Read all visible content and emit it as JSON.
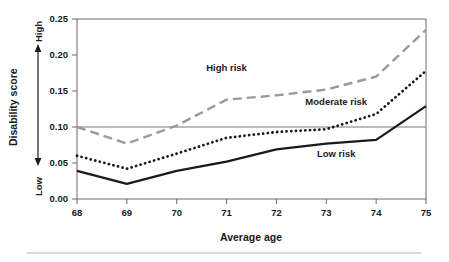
{
  "chart_data": {
    "type": "line",
    "title": "",
    "xlabel": "Average age",
    "ylabel": "Disability score",
    "x": [
      68,
      69,
      70,
      71,
      72,
      73,
      74,
      75
    ],
    "xlim": [
      68,
      75
    ],
    "ylim": [
      0.0,
      0.25
    ],
    "xticks": [
      "68",
      "69",
      "70",
      "71",
      "72",
      "73",
      "74",
      "75"
    ],
    "yticks": [
      "0.00",
      "0.05",
      "0.10",
      "0.15",
      "0.20",
      "0.25"
    ],
    "ytick_values": [
      0.0,
      0.05,
      0.1,
      0.15,
      0.2,
      0.25
    ],
    "y_axis_low_label": "Low",
    "y_axis_high_label": "High",
    "grid": "single horizontal reference line at y=0.10",
    "reference_line": 0.1,
    "legend_position": "inline annotations on plot",
    "series": [
      {
        "name": "High risk",
        "style": "dashed",
        "color": "#9a9a9a",
        "values": [
          0.1,
          0.077,
          0.102,
          0.138,
          0.144,
          0.152,
          0.17,
          0.235
        ],
        "label_x": 71.0,
        "label_y": 0.178
      },
      {
        "name": "Moderate risk",
        "style": "dotted",
        "color": "#1a1a1a",
        "values": [
          0.06,
          0.042,
          0.063,
          0.085,
          0.093,
          0.097,
          0.118,
          0.178
        ],
        "label_x": 73.2,
        "label_y": 0.131
      },
      {
        "name": "Low risk",
        "style": "solid",
        "color": "#1a1a1a",
        "values": [
          0.039,
          0.021,
          0.039,
          0.052,
          0.069,
          0.077,
          0.082,
          0.129
        ],
        "label_x": 73.2,
        "label_y": 0.058
      }
    ]
  },
  "labels": {
    "y_axis_title": "Disability score",
    "x_axis_title": "Average age",
    "high": "High",
    "low": "Low",
    "series_high": "High risk",
    "series_moderate": "Moderate risk",
    "series_low": "Low risk"
  },
  "colors": {
    "high_risk": "#9a9a9a",
    "moderate_risk": "#1a1a1a",
    "low_risk": "#1a1a1a",
    "axis": "#6a6a6a",
    "reference_line": "#6a6a6a",
    "caption_rule": "#b5b5b5",
    "text": "#1a1a1a"
  },
  "caption": {
    "rule_visible": true,
    "partial_text": ""
  }
}
